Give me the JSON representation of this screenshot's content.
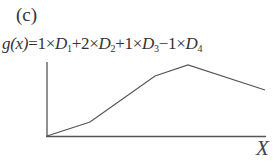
{
  "panel_label": "(c)",
  "formula": {
    "lhs": "g(x)",
    "eq": "=",
    "terms": [
      {
        "sign": "",
        "coef": "1",
        "var": "D",
        "sub": "1"
      },
      {
        "sign": "+",
        "coef": "2",
        "var": "D",
        "sub": "2"
      },
      {
        "sign": "+",
        "coef": "1",
        "var": "D",
        "sub": "3"
      },
      {
        "sign": "−",
        "coef": "1",
        "var": "D",
        "sub": "4"
      }
    ],
    "times": "×"
  },
  "axis": {
    "x_label": "X"
  },
  "colors": {
    "line": "#555555",
    "axis": "#555555"
  },
  "chart_data": {
    "type": "line",
    "title": "g(x)=1×D1+2×D2+1×D3−1×D4",
    "xlabel": "X",
    "ylabel": "",
    "points_px": [
      [
        47,
        136
      ],
      [
        90,
        122
      ],
      [
        155,
        76
      ],
      [
        188,
        65
      ],
      [
        265,
        90
      ]
    ],
    "x": [
      0,
      1,
      2,
      3,
      4
    ],
    "values": [
      0,
      1,
      3,
      4,
      3
    ],
    "grid": false
  }
}
